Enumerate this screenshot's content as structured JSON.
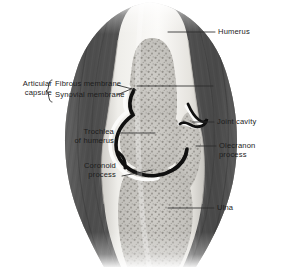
{
  "figure": {
    "kind": "anatomical-illustration",
    "style": "grayscale halftone medical illustration",
    "palette": {
      "background": "#ffffff",
      "muscle_dark": "#545454",
      "muscle_mid": "#6e6e6e",
      "muscle_light": "#8e8e8e",
      "bone_cortical": "#f2f1ee",
      "bone_shade": "#dedbd6",
      "marrow_fill": "#c9c7c2",
      "marrow_stipple": "#8d8a85",
      "cartilage_black": "#111111",
      "synovial_white": "#fdfdfd",
      "leader_line": "#2a2a2a",
      "label_text": "#1c1c1c"
    }
  },
  "labels": {
    "articular_capsule": "Articular\ncapsule",
    "fibrous_membrane": "Fibrous membrane",
    "synovial_membrane": "Synovial membrane",
    "trochlea": "Trochlea\nof humerus",
    "coronoid": "Coronoid\nprocess",
    "humerus": "Humerus",
    "joint_cavity": "Joint cavity",
    "olecranon": "Olecranon\nprocess",
    "ulna": "Ulna"
  }
}
